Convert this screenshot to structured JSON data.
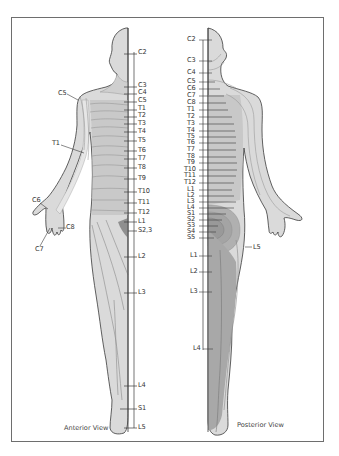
{
  "figure": {
    "type": "dermatome-map",
    "colors": {
      "skin_light": "#e0e0e0",
      "skin_mid": "#c8c8c8",
      "skin_dark": "#a6a6a6",
      "outline": "#3a3a3a",
      "band_lines": "#8a8a8a",
      "frame": "#6e6e6e"
    }
  },
  "anterior": {
    "caption": "Anterior View",
    "spine_labels": [
      {
        "text": "C2",
        "x": 137,
        "y": 51
      },
      {
        "text": "C3",
        "x": 137,
        "y": 84
      },
      {
        "text": "C4",
        "x": 137,
        "y": 91
      },
      {
        "text": "C5",
        "x": 137,
        "y": 99
      },
      {
        "text": "T1",
        "x": 137,
        "y": 107
      },
      {
        "text": "T2",
        "x": 137,
        "y": 114
      },
      {
        "text": "T3",
        "x": 137,
        "y": 121
      },
      {
        "text": "T4",
        "x": 137,
        "y": 129
      },
      {
        "text": "T5",
        "x": 137,
        "y": 138
      },
      {
        "text": "T6",
        "x": 137,
        "y": 148
      },
      {
        "text": "T7",
        "x": 137,
        "y": 156
      },
      {
        "text": "T8",
        "x": 137,
        "y": 165
      },
      {
        "text": "T9",
        "x": 137,
        "y": 176
      },
      {
        "text": "T10",
        "x": 137,
        "y": 189
      },
      {
        "text": "T11",
        "x": 137,
        "y": 200
      },
      {
        "text": "T12",
        "x": 137,
        "y": 210
      },
      {
        "text": "L1",
        "x": 137,
        "y": 219
      },
      {
        "text": "S2,3",
        "x": 137,
        "y": 228
      },
      {
        "text": "L2",
        "x": 137,
        "y": 254
      },
      {
        "text": "L3",
        "x": 137,
        "y": 290
      },
      {
        "text": "L4",
        "x": 137,
        "y": 383
      },
      {
        "text": "S1",
        "x": 137,
        "y": 406
      },
      {
        "text": "L5",
        "x": 137,
        "y": 425
      }
    ],
    "limb_labels": [
      {
        "text": "C5",
        "x": 58,
        "y": 95
      },
      {
        "text": "T1",
        "x": 52,
        "y": 143
      },
      {
        "text": "C6",
        "x": 32,
        "y": 200
      },
      {
        "text": "C8",
        "x": 66,
        "y": 226
      },
      {
        "text": "C7",
        "x": 35,
        "y": 249
      }
    ]
  },
  "posterior": {
    "caption": "Posterior View",
    "spine_labels": [
      {
        "text": "C2",
        "x": 186,
        "y": 37
      },
      {
        "text": "C3",
        "x": 186,
        "y": 58
      },
      {
        "text": "C4",
        "x": 186,
        "y": 70
      },
      {
        "text": "C5",
        "x": 186,
        "y": 79
      },
      {
        "text": "C6",
        "x": 186,
        "y": 86
      },
      {
        "text": "C7",
        "x": 186,
        "y": 93
      },
      {
        "text": "C8",
        "x": 186,
        "y": 100
      },
      {
        "text": "T1",
        "x": 186,
        "y": 107
      },
      {
        "text": "T2",
        "x": 186,
        "y": 114
      },
      {
        "text": "T3",
        "x": 186,
        "y": 121
      },
      {
        "text": "T4",
        "x": 186,
        "y": 128
      },
      {
        "text": "T5",
        "x": 186,
        "y": 134
      },
      {
        "text": "T6",
        "x": 186,
        "y": 140
      },
      {
        "text": "T7",
        "x": 186,
        "y": 147
      },
      {
        "text": "T8",
        "x": 186,
        "y": 154
      },
      {
        "text": "T9",
        "x": 186,
        "y": 160
      },
      {
        "text": "T10",
        "x": 184,
        "y": 167
      },
      {
        "text": "T11",
        "x": 184,
        "y": 173
      },
      {
        "text": "T12",
        "x": 184,
        "y": 180
      },
      {
        "text": "L1",
        "x": 186,
        "y": 187
      },
      {
        "text": "L2",
        "x": 186,
        "y": 193
      },
      {
        "text": "L3",
        "x": 186,
        "y": 199
      },
      {
        "text": "L4",
        "x": 186,
        "y": 205
      },
      {
        "text": "S1",
        "x": 186,
        "y": 211
      },
      {
        "text": "S2",
        "x": 186,
        "y": 217
      },
      {
        "text": "S3",
        "x": 186,
        "y": 223
      },
      {
        "text": "S4",
        "x": 186,
        "y": 229
      },
      {
        "text": "S5",
        "x": 186,
        "y": 235
      },
      {
        "text": "L1",
        "x": 190,
        "y": 253
      },
      {
        "text": "L2",
        "x": 190,
        "y": 269
      },
      {
        "text": "L3",
        "x": 190,
        "y": 289
      },
      {
        "text": "L4",
        "x": 193,
        "y": 346
      }
    ],
    "limb_labels": [
      {
        "text": "L5",
        "x": 253,
        "y": 244
      }
    ]
  }
}
